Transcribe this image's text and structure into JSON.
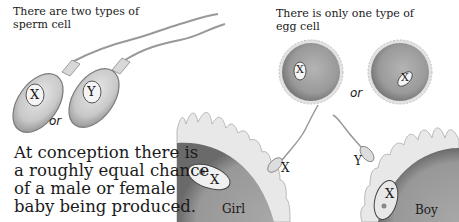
{
  "captions": {
    "sperm_title_line1": "There are two types of",
    "sperm_title_line2": "sperm cell",
    "egg_title_line1": "There is only one type of",
    "egg_title_line2": "egg cell",
    "conclusion_lines": [
      "At conception there is",
      "a roughly equal chance",
      "of a male or female",
      "baby being produced."
    ]
  },
  "sperm_cells": [
    {
      "chromosome": "X"
    },
    {
      "chromosome": "Y"
    }
  ],
  "sperm_or_label": "or",
  "egg_cells": [
    {
      "chromosome": "X"
    },
    {
      "chromosome": "X"
    }
  ],
  "egg_or_label": "or",
  "fertilization": [
    {
      "outcome": "Girl",
      "sperm_chromosome": "X",
      "egg_chromosome": "X"
    },
    {
      "outcome": "Boy",
      "sperm_chromosome": "Y",
      "egg_chromosome": "X"
    }
  ],
  "colors": {
    "cell_gray": "#9a9a9a",
    "cell_dark": "#6e6e6e",
    "membrane_light": "#e4e4e4",
    "text": "#1a1a1a"
  }
}
